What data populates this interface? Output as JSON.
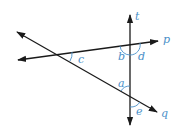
{
  "diagram": {
    "colors": {
      "line": "#1a1a1a",
      "label": "#4a90c8",
      "arc": "#4a90c8"
    },
    "lines": [
      {
        "name": "t",
        "label": "t"
      },
      {
        "name": "p",
        "label": "p"
      },
      {
        "name": "q",
        "label": "q"
      }
    ],
    "angles": [
      {
        "name": "a",
        "label": "a"
      },
      {
        "name": "b",
        "label": "b"
      },
      {
        "name": "c",
        "label": "c"
      },
      {
        "name": "d",
        "label": "d"
      },
      {
        "name": "e",
        "label": "e"
      }
    ]
  }
}
